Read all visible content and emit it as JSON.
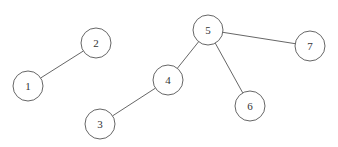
{
  "diagram": {
    "type": "graph",
    "directed": false,
    "style": {
      "stroke_color": "#555555",
      "node_fill": "#ffffff",
      "text_color": "#333333",
      "node_radius": 15
    },
    "nodes": [
      {
        "id": "1",
        "label": "1",
        "x": 28,
        "y": 86
      },
      {
        "id": "2",
        "label": "2",
        "x": 96,
        "y": 43
      },
      {
        "id": "3",
        "label": "3",
        "x": 100,
        "y": 124
      },
      {
        "id": "4",
        "label": "4",
        "x": 168,
        "y": 80
      },
      {
        "id": "5",
        "label": "5",
        "x": 208,
        "y": 30
      },
      {
        "id": "6",
        "label": "6",
        "x": 250,
        "y": 106
      },
      {
        "id": "7",
        "label": "7",
        "x": 310,
        "y": 46
      }
    ],
    "edges": [
      {
        "from": "1",
        "to": "2"
      },
      {
        "from": "3",
        "to": "4"
      },
      {
        "from": "4",
        "to": "5"
      },
      {
        "from": "5",
        "to": "6"
      },
      {
        "from": "5",
        "to": "7"
      }
    ]
  }
}
